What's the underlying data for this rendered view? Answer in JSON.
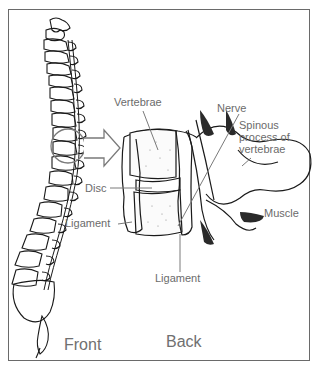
{
  "figure": {
    "labels": {
      "vertebrae": "Vertebrae",
      "nerve": "Nerve",
      "spinous_line1": "Spinous",
      "spinous_line2": "process of",
      "spinous_line3": "vertebrae",
      "disc": "Disc",
      "ligament_left": "Ligament",
      "ligament_bottom": "Ligament",
      "muscle": "Muscle",
      "front": "Front",
      "back": "Back"
    },
    "colors": {
      "line": "#1a1a1a",
      "label": "#6b6b6b",
      "border": "#6a6a6a",
      "shade": "#2a2a2a",
      "callout": "#7a7a7a"
    }
  }
}
